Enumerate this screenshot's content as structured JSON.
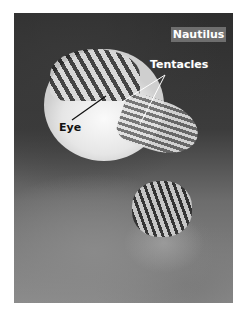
{
  "image": {
    "subject": "Nautilus photograph",
    "labels": {
      "title": "Nautilus",
      "tentacles": "Tentacles",
      "eye": "Eye"
    },
    "colors": {
      "title_box": "#6e6e6e",
      "label_text": "#ffffff",
      "eye_label_text": "#111111"
    }
  }
}
